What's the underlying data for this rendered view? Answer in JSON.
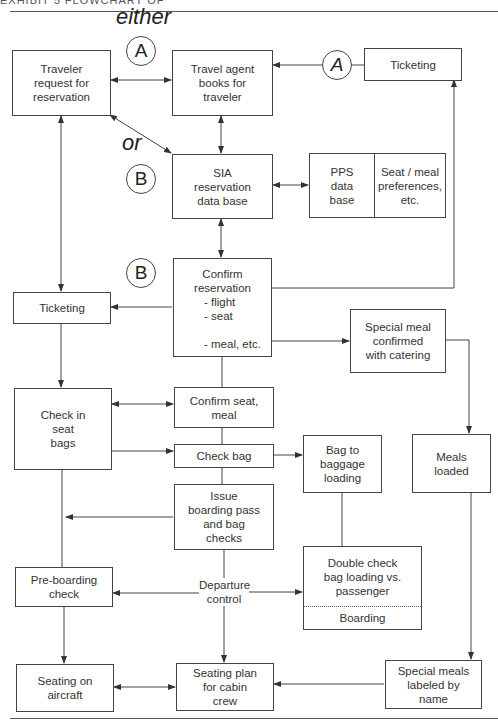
{
  "header": {
    "text": "EXHIBIT 5    FLOWCHART OF"
  },
  "labels": {
    "either": "either",
    "or": "or",
    "departure_control": "Departure\ncontrol"
  },
  "markers": {
    "a_top": "A",
    "a_right": "A",
    "b_mid": "B",
    "b_low": "B"
  },
  "nodes": {
    "traveler_request": "Traveler\nrequest for\nreservation",
    "travel_agent": "Travel agent\nbooks for\ntraveler",
    "ticketing_top": "Ticketing",
    "sia_database": "SIA\nreservation\ndata base",
    "pps_database": "PPS\ndata\nbase",
    "seat_meal_prefs": "Seat / meal\npreferences,\netc.",
    "confirm_reservation": {
      "title": "Confirm\nreservation",
      "items": [
        "- flight",
        "- seat",
        "- meal, etc."
      ]
    },
    "ticketing_left": "Ticketing",
    "special_meal_confirmed": "Special meal\nconfirmed\nwith catering",
    "check_in": "Check in\nseat\nbags",
    "confirm_seat_meal": "Confirm seat,\nmeal",
    "check_bag": "Check bag",
    "bag_to_loading": "Bag to\nbaggage\nloading",
    "meals_loaded": "Meals\nloaded",
    "issue_boarding_pass": "Issue\nboarding pass\nand bag\nchecks",
    "pre_boarding_check": "Pre-boarding\ncheck",
    "double_check": "Double check\nbag loading vs.\npassenger",
    "boarding": "Boarding",
    "seating_on_aircraft": "Seating on\naircraft",
    "seating_plan": "Seating plan\nfor cabin\ncrew",
    "special_meals_labeled": "Special meals\nlabeled by\nname"
  }
}
